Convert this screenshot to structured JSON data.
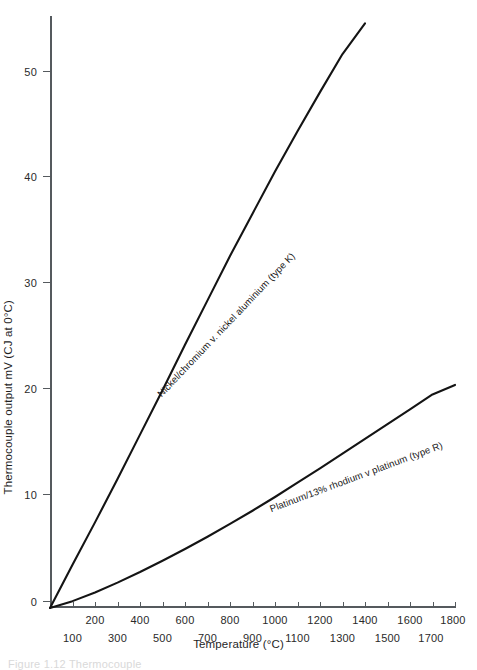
{
  "chart_data": {
    "type": "line",
    "title": "",
    "xlabel": "Temperature (°C)",
    "ylabel": "Thermocouple output mV (CJ at 0°C)",
    "xlim": [
      0,
      1800
    ],
    "ylim": [
      0,
      56
    ],
    "grid": false,
    "legend_position": "inline-along-curves",
    "x_ticks_row_major": [
      200,
      400,
      600,
      800,
      1000,
      1200,
      1400,
      1600,
      1800
    ],
    "x_ticks_row_minor": [
      100,
      300,
      500,
      700,
      900,
      1100,
      1300,
      1500,
      1700
    ],
    "y_ticks": [
      0,
      10,
      20,
      30,
      40,
      50
    ],
    "series": [
      {
        "name": "Nickel/chromium v. nickel aluminium (type K)",
        "short_name": "type K",
        "color": "#141414",
        "x": [
          0,
          100,
          200,
          300,
          400,
          500,
          600,
          700,
          800,
          900,
          1000,
          1100,
          1200,
          1300,
          1400
        ],
        "values": [
          0,
          4.1,
          8.1,
          12.2,
          16.4,
          20.6,
          24.9,
          29.1,
          33.3,
          37.3,
          41.3,
          45.1,
          48.8,
          52.4,
          55.3
        ]
      },
      {
        "name": "Platinum/13% rhodium v platinum (type R)",
        "short_name": "type R",
        "color": "#141414",
        "x": [
          0,
          100,
          200,
          300,
          400,
          500,
          600,
          700,
          800,
          900,
          1000,
          1100,
          1200,
          1300,
          1400,
          1500,
          1600,
          1700,
          1800
        ],
        "values": [
          0,
          0.65,
          1.47,
          2.4,
          3.4,
          4.47,
          5.58,
          6.74,
          7.95,
          9.2,
          10.5,
          11.85,
          13.2,
          14.6,
          16.0,
          17.4,
          18.8,
          20.2,
          21.1
        ]
      }
    ]
  },
  "axes": {
    "y_title": "Thermocouple output mV (CJ at 0°C)",
    "x_title": "Temperature (°C)"
  },
  "y_tick_labels": [
    "50",
    "40",
    "30",
    "20",
    "10",
    "0"
  ],
  "x_tick_labels_top": [
    "200",
    "400",
    "600",
    "800",
    "1000",
    "1200",
    "1400",
    "1600",
    "1800"
  ],
  "x_tick_labels_bottom": [
    "100",
    "300",
    "500",
    "700",
    "900",
    "1100",
    "1300",
    "1500",
    "1700"
  ],
  "series_labels": {
    "type_k": "Nickel/chromium v. nickel aluminium (type K)",
    "type_r": "Platinum/13% rhodium v platinum (type R)"
  },
  "caption": "Figure 1.12  Thermocouple"
}
